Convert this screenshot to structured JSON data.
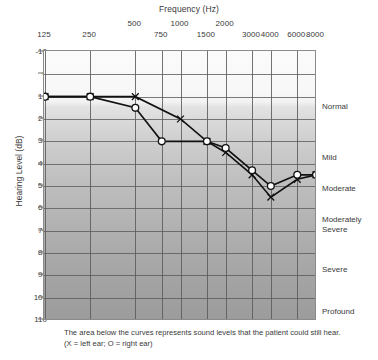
{
  "chart_data": {
    "type": "line",
    "title": "Frequency (Hz)",
    "xlabel": "Frequency (Hz)",
    "ylabel": "Hearing Level (dB)",
    "xscale": "log",
    "xlim": [
      125,
      8000
    ],
    "ylim": [
      -10,
      110
    ],
    "y_inverted": true,
    "grid": true,
    "legend": "none",
    "x_ticks": [
      {
        "value": 125,
        "label": "125",
        "row": "bottom"
      },
      {
        "value": 250,
        "label": "250",
        "row": "bottom"
      },
      {
        "value": 500,
        "label": "500",
        "row": "top"
      },
      {
        "value": 750,
        "label": "750",
        "row": "bottom"
      },
      {
        "value": 1000,
        "label": "1000",
        "row": "top"
      },
      {
        "value": 1500,
        "label": "1500",
        "row": "bottom"
      },
      {
        "value": 2000,
        "label": "2000",
        "row": "top"
      },
      {
        "value": 3000,
        "label": "3000",
        "row": "bottom"
      },
      {
        "value": 4000,
        "label": "4000",
        "row": "bottom"
      },
      {
        "value": 6000,
        "label": "6000",
        "row": "bottom"
      },
      {
        "value": 8000,
        "label": "8000",
        "row": "bottom"
      }
    ],
    "y_ticks": [
      {
        "value": -10,
        "label": "-10"
      },
      {
        "value": 0,
        "label": "0"
      },
      {
        "value": 10,
        "label": "10"
      },
      {
        "value": 20,
        "label": "20"
      },
      {
        "value": 30,
        "label": "30"
      },
      {
        "value": 40,
        "label": "40"
      },
      {
        "value": 50,
        "label": "50"
      },
      {
        "value": 60,
        "label": "60"
      },
      {
        "value": 70,
        "label": "70"
      },
      {
        "value": 80,
        "label": "80"
      },
      {
        "value": 90,
        "label": "90"
      },
      {
        "value": 100,
        "label": "100"
      },
      {
        "value": 110,
        "label": "110"
      }
    ],
    "series": [
      {
        "name": "left ear",
        "marker": "X",
        "x": [
          125,
          250,
          500,
          1000,
          1500,
          2000,
          3000,
          4000,
          6000,
          8000
        ],
        "values": [
          10,
          10,
          10,
          20,
          30,
          35,
          45,
          55,
          47,
          45
        ]
      },
      {
        "name": "right ear",
        "marker": "O",
        "x": [
          125,
          250,
          500,
          750,
          1500,
          2000,
          3000,
          4000,
          6000,
          8000
        ],
        "values": [
          10,
          10,
          15,
          30,
          30,
          33,
          43,
          50,
          45,
          45
        ]
      }
    ],
    "band_labels": [
      {
        "label": "Normal",
        "db": 15
      },
      {
        "label": "Mild",
        "db": 38
      },
      {
        "label": "Moderate",
        "db": 52
      },
      {
        "label": "Moderately Severe",
        "db": 68
      },
      {
        "label": "Severe",
        "db": 88
      },
      {
        "label": "Profound",
        "db": 107
      }
    ],
    "annotations": [
      "The area below the curves represents sound levels that the patient could still hear.",
      "(X = left ear; O = right ear)"
    ]
  },
  "axes": {
    "frequency_title": "Frequency (Hz)",
    "hearing_level_title": "Hearing Level (dB)"
  },
  "severity": {
    "normal": "Normal",
    "mild": "Mild",
    "moderate": "Moderate",
    "moderately_severe_line1": "Moderately",
    "moderately_severe_line2": "Severe",
    "severe": "Severe",
    "profound": "Profound"
  },
  "caption": {
    "line1": "The area below the curves represents sound levels that the patient could still hear.",
    "line2": "(X = left ear; O = right ear)"
  },
  "colors": {
    "curve": "#111111",
    "grid": "#5a5a5a",
    "border": "#8a8a8a",
    "text": "#3a3a3a",
    "marker_fill": "#ffffff"
  }
}
